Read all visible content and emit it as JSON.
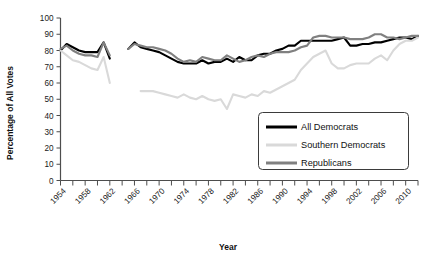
{
  "chart_data": {
    "type": "line",
    "title": "",
    "xlabel": "Year",
    "ylabel": "Percentage of All Votes",
    "xlim": [
      1954,
      2012
    ],
    "ylim": [
      0,
      100
    ],
    "ytick_step": 10,
    "yticks": [
      0,
      10,
      20,
      30,
      40,
      50,
      60,
      70,
      80,
      90,
      100
    ],
    "xticks": [
      1954,
      1958,
      1962,
      1966,
      1970,
      1974,
      1978,
      1982,
      1986,
      1990,
      1994,
      1998,
      2002,
      2006,
      2010
    ],
    "xtick_minor_step": 2,
    "grid": false,
    "legend_position": "center-right",
    "series": [
      {
        "name": "All Democrats",
        "color": "#000000",
        "width": 2.1,
        "x": [
          1954,
          1955,
          1956,
          1957,
          1958,
          1959,
          1960,
          1961,
          1962,
          1965,
          1966,
          1967,
          1968,
          1969,
          1970,
          1971,
          1972,
          1973,
          1974,
          1975,
          1976,
          1977,
          1978,
          1979,
          1980,
          1981,
          1982,
          1983,
          1984,
          1985,
          1986,
          1987,
          1988,
          1989,
          1990,
          1991,
          1992,
          1993,
          1994,
          1995,
          1996,
          1997,
          1998,
          1999,
          2000,
          2001,
          2002,
          2003,
          2004,
          2005,
          2006,
          2007,
          2008,
          2009,
          2010,
          2011,
          2012
        ],
        "values": [
          80,
          84,
          82,
          80,
          79,
          79,
          79,
          85,
          75,
          81,
          85,
          82,
          81,
          80,
          79,
          77,
          75,
          73,
          72,
          72,
          72,
          74,
          72,
          73,
          73,
          75,
          73,
          76,
          74,
          74,
          77,
          78,
          78,
          80,
          81,
          83,
          83,
          86,
          86,
          86,
          86,
          86,
          86,
          87,
          88,
          83,
          83,
          84,
          84,
          85,
          85,
          86,
          87,
          88,
          88,
          87,
          89
        ]
      },
      {
        "name": "Southern Democrats",
        "color": "#d9d9d9",
        "width": 2.1,
        "x": [
          1954,
          1955,
          1956,
          1957,
          1958,
          1959,
          1960,
          1961,
          1962,
          1967,
          1968,
          1969,
          1970,
          1971,
          1972,
          1973,
          1974,
          1975,
          1976,
          1977,
          1978,
          1979,
          1980,
          1981,
          1982,
          1983,
          1984,
          1985,
          1986,
          1987,
          1988,
          1989,
          1990,
          1991,
          1992,
          1993,
          1994,
          1995,
          1996,
          1997,
          1998,
          1999,
          2000,
          2001,
          2002,
          2003,
          2004,
          2005,
          2006,
          2007,
          2008,
          2009,
          2010,
          2011,
          2012
        ],
        "values": [
          80,
          77,
          74,
          73,
          71,
          69,
          68,
          76,
          60,
          55,
          55,
          55,
          54,
          53,
          52,
          51,
          53,
          51,
          50,
          52,
          50,
          49,
          50,
          44,
          53,
          52,
          51,
          53,
          52,
          55,
          54,
          56,
          58,
          60,
          62,
          68,
          72,
          76,
          78,
          80,
          72,
          69,
          69,
          71,
          72,
          72,
          72,
          75,
          77,
          74,
          80,
          84,
          86,
          86,
          88
        ]
      },
      {
        "name": "Republicans",
        "color": "#808080",
        "width": 2.1,
        "x": [
          1954,
          1955,
          1956,
          1957,
          1958,
          1959,
          1960,
          1961,
          1962,
          1965,
          1966,
          1967,
          1968,
          1969,
          1970,
          1971,
          1972,
          1973,
          1974,
          1975,
          1976,
          1977,
          1978,
          1979,
          1980,
          1981,
          1982,
          1983,
          1984,
          1985,
          1986,
          1987,
          1988,
          1989,
          1990,
          1991,
          1992,
          1993,
          1994,
          1995,
          1996,
          1997,
          1998,
          1999,
          2000,
          2001,
          2002,
          2003,
          2004,
          2005,
          2006,
          2007,
          2008,
          2009,
          2010,
          2011,
          2012
        ],
        "values": [
          81,
          83,
          80,
          78,
          77,
          77,
          76,
          85,
          77,
          81,
          84,
          83,
          82,
          82,
          81,
          80,
          78,
          75,
          73,
          74,
          73,
          76,
          75,
          74,
          74,
          77,
          75,
          73,
          74,
          76,
          77,
          76,
          78,
          79,
          79,
          79,
          80,
          82,
          83,
          88,
          89,
          89,
          88,
          88,
          88,
          87,
          87,
          87,
          88,
          90,
          90,
          88,
          88,
          87,
          88,
          89,
          89
        ]
      }
    ]
  },
  "legend": {
    "items": [
      {
        "label": "All Democrats",
        "color": "#000000"
      },
      {
        "label": "Southern Democrats",
        "color": "#d9d9d9"
      },
      {
        "label": "Republicans",
        "color": "#808080"
      }
    ]
  },
  "cropped_text": {
    "top": "",
    "bottom": ""
  }
}
